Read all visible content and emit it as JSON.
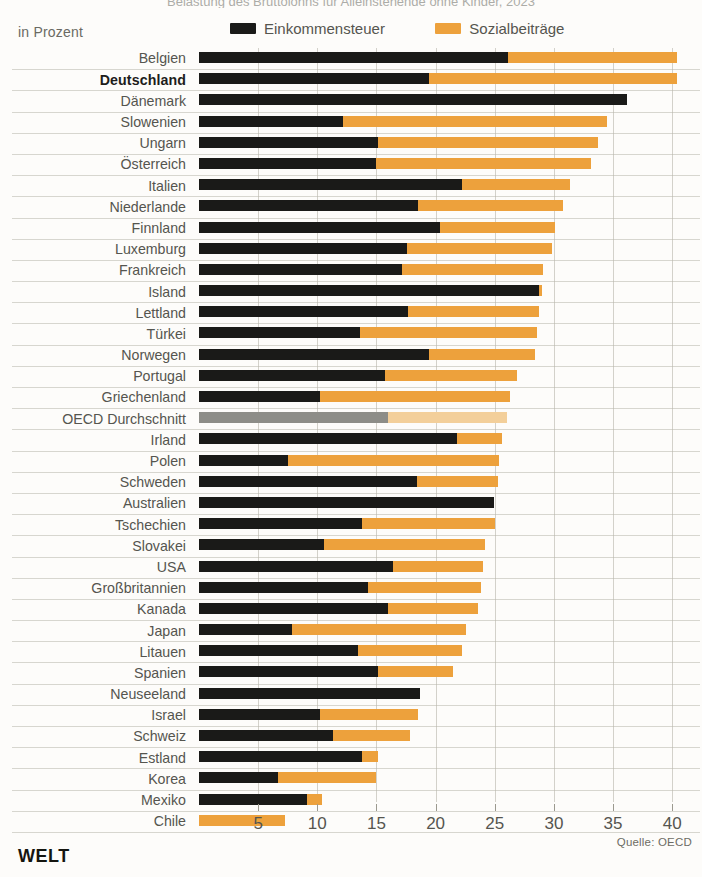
{
  "header": {
    "clipped_title": "Belastung des Bruttolohns für Alleinstehende ohne Kinder, 2023",
    "subtitle": "in Prozent"
  },
  "legend": {
    "items": [
      {
        "label": "Einkommensteuer",
        "color": "#1a1a18",
        "key": "tax"
      },
      {
        "label": "Sozialbeiträge",
        "color": "#eda13c",
        "key": "soc"
      }
    ]
  },
  "footer": {
    "brand": "WELT",
    "source": "Quelle: OECD"
  },
  "chart_data": {
    "type": "bar",
    "orientation": "horizontal",
    "stacked": true,
    "title": "Belastung des Bruttolohns für Alleinstehende ohne Kinder, 2023",
    "xlabel": "in Prozent",
    "ylabel": "",
    "xlim": [
      0,
      41.5
    ],
    "xticks": [
      5,
      10,
      15,
      20,
      25,
      30,
      35,
      40
    ],
    "grid": true,
    "legend_position": "top-right",
    "series": [
      {
        "name": "Einkommensteuer",
        "color": "#1a1a18"
      },
      {
        "name": "Sozialbeiträge",
        "color": "#eda13c"
      }
    ],
    "categories": [
      "Belgien",
      "Deutschland",
      "Dänemark",
      "Slowenien",
      "Ungarn",
      "Österreich",
      "Italien",
      "Niederlande",
      "Finnland",
      "Luxemburg",
      "Frankreich",
      "Island",
      "Lettland",
      "Türkei",
      "Norwegen",
      "Portugal",
      "Griechenland",
      "OECD Durchschnitt",
      "Irland",
      "Polen",
      "Schweden",
      "Australien",
      "Tschechien",
      "Slovakei",
      "USA",
      "Großbritannien",
      "Kanada",
      "Japan",
      "Litauen",
      "Spanien",
      "Neuseeland",
      "Israel",
      "Schweiz",
      "Estland",
      "Korea",
      "Mexiko",
      "Chile"
    ],
    "rows": [
      {
        "label": "Belgien",
        "tax": 26.1,
        "soc": 14.3,
        "total": 40.4,
        "highlight": false,
        "bold": false
      },
      {
        "label": "Deutschland",
        "tax": 19.4,
        "soc": 21.0,
        "total": 40.4,
        "highlight": false,
        "bold": true
      },
      {
        "label": "Dänemark",
        "tax": 36.2,
        "soc": 0.0,
        "total": 36.2,
        "highlight": false,
        "bold": false
      },
      {
        "label": "Slowenien",
        "tax": 12.2,
        "soc": 22.3,
        "total": 34.5,
        "highlight": false,
        "bold": false
      },
      {
        "label": "Ungarn",
        "tax": 15.1,
        "soc": 18.6,
        "total": 33.7,
        "highlight": false,
        "bold": false
      },
      {
        "label": "Österreich",
        "tax": 15.0,
        "soc": 18.1,
        "total": 33.1,
        "highlight": false,
        "bold": false
      },
      {
        "label": "Italien",
        "tax": 22.2,
        "soc": 9.2,
        "total": 31.4,
        "highlight": false,
        "bold": false
      },
      {
        "label": "Niederlande",
        "tax": 18.5,
        "soc": 12.3,
        "total": 30.8,
        "highlight": false,
        "bold": false
      },
      {
        "label": "Finnland",
        "tax": 20.4,
        "soc": 9.7,
        "total": 30.1,
        "highlight": false,
        "bold": false
      },
      {
        "label": "Luxemburg",
        "tax": 17.6,
        "soc": 12.2,
        "total": 29.8,
        "highlight": false,
        "bold": false
      },
      {
        "label": "Frankreich",
        "tax": 17.2,
        "soc": 11.9,
        "total": 29.1,
        "highlight": false,
        "bold": false
      },
      {
        "label": "Island",
        "tax": 28.7,
        "soc": 0.3,
        "total": 29.0,
        "highlight": false,
        "bold": false
      },
      {
        "label": "Lettland",
        "tax": 17.7,
        "soc": 11.0,
        "total": 28.7,
        "highlight": false,
        "bold": false
      },
      {
        "label": "Türkei",
        "tax": 13.6,
        "soc": 15.0,
        "total": 28.6,
        "highlight": false,
        "bold": false
      },
      {
        "label": "Norwegen",
        "tax": 19.4,
        "soc": 9.0,
        "total": 28.4,
        "highlight": false,
        "bold": false
      },
      {
        "label": "Portugal",
        "tax": 15.7,
        "soc": 11.2,
        "total": 26.9,
        "highlight": false,
        "bold": false
      },
      {
        "label": "Griechenland",
        "tax": 10.2,
        "soc": 16.1,
        "total": 26.3,
        "highlight": false,
        "bold": false
      },
      {
        "label": "OECD Durchschnitt",
        "tax": 16.0,
        "soc": 10.0,
        "total": 26.0,
        "highlight": true,
        "bold": false
      },
      {
        "label": "Irland",
        "tax": 21.8,
        "soc": 3.8,
        "total": 25.6,
        "highlight": false,
        "bold": false
      },
      {
        "label": "Polen",
        "tax": 7.5,
        "soc": 17.9,
        "total": 25.4,
        "highlight": false,
        "bold": false
      },
      {
        "label": "Schweden",
        "tax": 18.4,
        "soc": 6.9,
        "total": 25.3,
        "highlight": false,
        "bold": false
      },
      {
        "label": "Australien",
        "tax": 24.9,
        "soc": 0.0,
        "total": 24.9,
        "highlight": false,
        "bold": false
      },
      {
        "label": "Tschechien",
        "tax": 13.8,
        "soc": 11.2,
        "total": 25.0,
        "highlight": false,
        "bold": false
      },
      {
        "label": "Slovakei",
        "tax": 10.6,
        "soc": 13.6,
        "total": 24.2,
        "highlight": false,
        "bold": false
      },
      {
        "label": "USA",
        "tax": 16.4,
        "soc": 7.6,
        "total": 24.0,
        "highlight": false,
        "bold": false
      },
      {
        "label": "Großbritannien",
        "tax": 14.3,
        "soc": 9.5,
        "total": 23.8,
        "highlight": false,
        "bold": false
      },
      {
        "label": "Kanada",
        "tax": 16.0,
        "soc": 7.6,
        "total": 23.6,
        "highlight": false,
        "bold": false
      },
      {
        "label": "Japan",
        "tax": 7.9,
        "soc": 14.7,
        "total": 22.6,
        "highlight": false,
        "bold": false
      },
      {
        "label": "Litauen",
        "tax": 13.4,
        "soc": 8.8,
        "total": 22.2,
        "highlight": false,
        "bold": false
      },
      {
        "label": "Spanien",
        "tax": 15.1,
        "soc": 6.4,
        "total": 21.5,
        "highlight": false,
        "bold": false
      },
      {
        "label": "Neuseeland",
        "tax": 18.7,
        "soc": 0.0,
        "total": 18.7,
        "highlight": false,
        "bold": false
      },
      {
        "label": "Israel",
        "tax": 10.2,
        "soc": 8.3,
        "total": 18.5,
        "highlight": false,
        "bold": false
      },
      {
        "label": "Schweiz",
        "tax": 11.3,
        "soc": 6.5,
        "total": 17.8,
        "highlight": false,
        "bold": false
      },
      {
        "label": "Estland",
        "tax": 13.8,
        "soc": 1.3,
        "total": 15.1,
        "highlight": false,
        "bold": false
      },
      {
        "label": "Korea",
        "tax": 6.7,
        "soc": 8.3,
        "total": 15.0,
        "highlight": false,
        "bold": false
      },
      {
        "label": "Mexiko",
        "tax": 9.1,
        "soc": 1.3,
        "total": 10.4,
        "highlight": false,
        "bold": false
      },
      {
        "label": "Chile",
        "tax": 0.0,
        "soc": 7.3,
        "total": 7.3,
        "highlight": false,
        "bold": false
      }
    ]
  }
}
